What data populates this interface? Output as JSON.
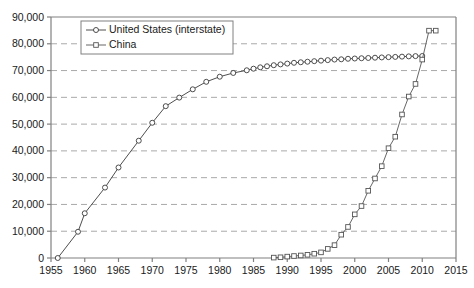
{
  "chart_data": {
    "type": "line",
    "title": "",
    "subtitle": "",
    "xlabel": "",
    "ylabel": "",
    "xlim": [
      1955,
      2015
    ],
    "ylim": [
      0,
      90000
    ],
    "xticks": [
      1955,
      1960,
      1965,
      1970,
      1975,
      1980,
      1985,
      1990,
      1995,
      2000,
      2005,
      2010,
      2015
    ],
    "xtick_labels": [
      "1955",
      "1960",
      "1965",
      "1970",
      "1975",
      "1980",
      "1985",
      "1990",
      "1995",
      "2000",
      "2005",
      "2010",
      "2015"
    ],
    "yticks": [
      0,
      10000,
      20000,
      30000,
      40000,
      50000,
      60000,
      70000,
      80000,
      90000
    ],
    "ytick_labels": [
      "0",
      "10,000",
      "20,000",
      "30,000",
      "40,000",
      "50,000",
      "60,000",
      "70,000",
      "80,000",
      "90,000"
    ],
    "grid": "horizontal-dashed",
    "legend_position": "top-left-inside",
    "series": [
      {
        "name": "United States (interstate)",
        "marker": "circle-open",
        "color": "#3a3a3a",
        "x": [
          1956,
          1959,
          1960,
          1963,
          1965,
          1968,
          1970,
          1972,
          1974,
          1976,
          1978,
          1980,
          1982,
          1984,
          1985,
          1986,
          1987,
          1988,
          1989,
          1990,
          1991,
          1992,
          1993,
          1994,
          1995,
          1996,
          1997,
          1998,
          1999,
          2000,
          2001,
          2002,
          2003,
          2004,
          2005,
          2006,
          2007,
          2008,
          2009,
          2010
        ],
        "y": [
          0,
          9800,
          16700,
          26300,
          33800,
          43800,
          50500,
          56700,
          59900,
          63000,
          65800,
          67700,
          69100,
          70100,
          70700,
          71200,
          71600,
          72000,
          72300,
          72600,
          72900,
          73100,
          73300,
          73500,
          73700,
          73900,
          74100,
          74200,
          74400,
          74500,
          74600,
          74700,
          74800,
          74900,
          75000,
          75100,
          75200,
          75300,
          75400,
          75440
        ]
      },
      {
        "name": "China",
        "marker": "square-open",
        "color": "#555555",
        "x": [
          1988,
          1989,
          1990,
          1991,
          1992,
          1993,
          1994,
          1995,
          1996,
          1997,
          1998,
          1999,
          2000,
          2001,
          2002,
          2003,
          2004,
          2005,
          2006,
          2007,
          2008,
          2009,
          2010,
          2011,
          2012
        ],
        "y": [
          150,
          270,
          520,
          740,
          950,
          1200,
          1600,
          2100,
          3400,
          4800,
          8700,
          11600,
          16300,
          19400,
          25100,
          29700,
          34300,
          41000,
          45300,
          53600,
          60300,
          65000,
          74100,
          84900,
          84900
        ]
      }
    ],
    "annotations": []
  },
  "legend": {
    "items": [
      {
        "label": "United States (interstate)",
        "marker": "circle-open"
      },
      {
        "label": "China",
        "marker": "square-open"
      }
    ]
  },
  "colors": {
    "axis": "#808080",
    "grid": "#a9a9a9",
    "series_us": "#3a3a3a",
    "series_cn": "#555555",
    "text": "#1a1a1a",
    "background": "#ffffff"
  }
}
